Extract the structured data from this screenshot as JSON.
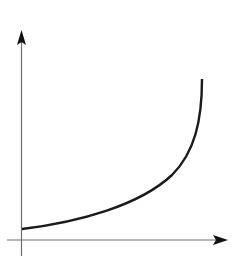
{
  "diagram": {
    "type": "axes-with-curve",
    "colors": {
      "axis": "#6e6e6e",
      "arrowhead": "#111111",
      "curve": "#1a1a1a",
      "background": "#ffffff"
    },
    "axes": {
      "x_label": "",
      "y_label": "",
      "origin_label": ""
    },
    "curve": {
      "shape": "convex-increasing",
      "start": [
        22,
        229
      ],
      "end": [
        202,
        79
      ]
    }
  }
}
